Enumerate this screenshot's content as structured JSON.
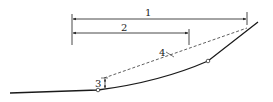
{
  "diagram": {
    "labels": {
      "l1": "1",
      "l2": "2",
      "l3": "3",
      "l4": "4"
    },
    "colors": {
      "stroke": "#1a1a1a",
      "background": "#ffffff"
    }
  }
}
